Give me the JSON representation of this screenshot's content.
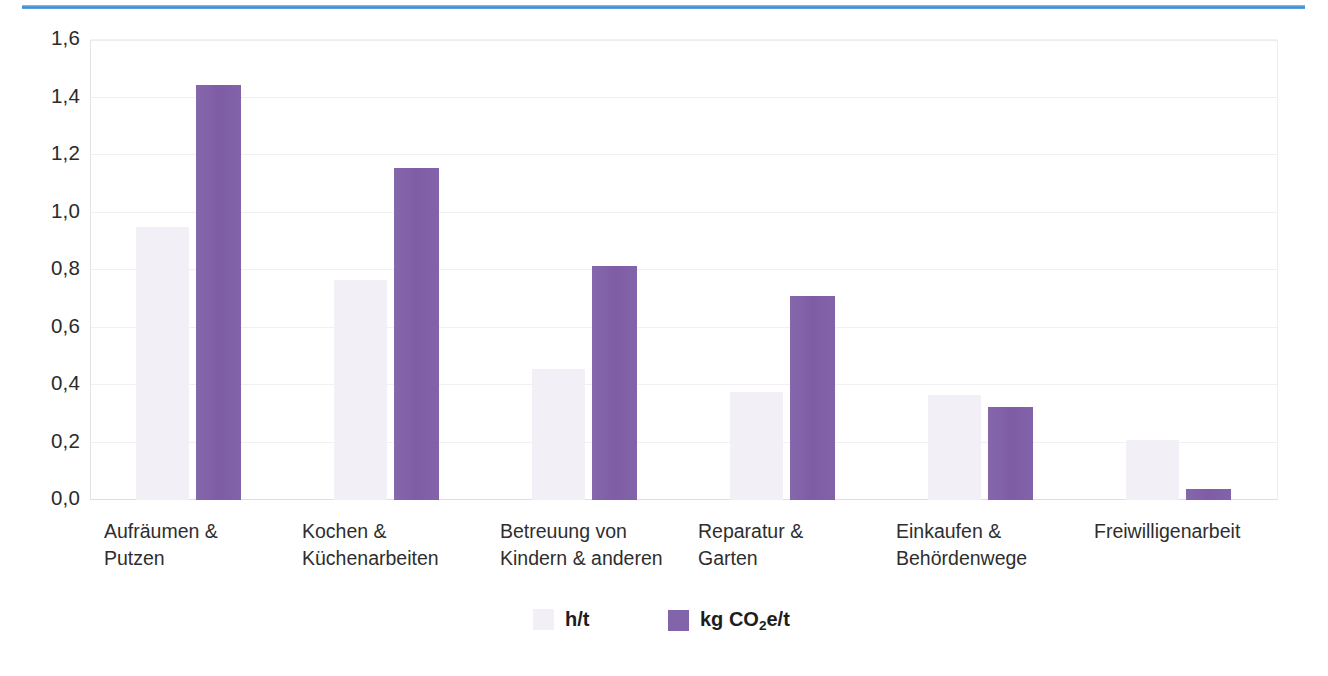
{
  "decor": {
    "top_rule_color": "#4a95d9"
  },
  "chart_data": {
    "type": "bar",
    "title": "",
    "xlabel": "",
    "ylabel": "",
    "ylim": [
      0.0,
      1.6
    ],
    "grid": true,
    "legend_position": "bottom",
    "y_ticks": [
      "0,0",
      "0,2",
      "0,4",
      "0,6",
      "0,8",
      "1,0",
      "1,2",
      "1,4",
      "1,6"
    ],
    "y_tick_values": [
      0.0,
      0.2,
      0.4,
      0.6,
      0.8,
      1.0,
      1.2,
      1.4,
      1.6
    ],
    "categories": [
      "Aufräumen &\nPutzen",
      "Kochen &\nKüchenarbeiten",
      "Betreuung von\nKindern & anderen",
      "Reparatur &\nGarten",
      "Einkaufen &\nBehördenwege",
      "Freiwilligenarbeit"
    ],
    "series": [
      {
        "name": "h/t",
        "color": "#f3eff6",
        "values": [
          0.95,
          0.765,
          0.455,
          0.375,
          0.365,
          0.21
        ]
      },
      {
        "name": "kg CO2e/t",
        "color": "#8264ab",
        "values": [
          1.445,
          1.155,
          0.815,
          0.71,
          0.325,
          0.04
        ]
      }
    ],
    "legend": [
      {
        "label_html": "h/t",
        "label": "h/t",
        "color": "#f3eff6"
      },
      {
        "label_html": "kg CO<sub>2</sub>e/t",
        "label": "kg CO2e/t",
        "color": "#8264ab"
      }
    ]
  }
}
